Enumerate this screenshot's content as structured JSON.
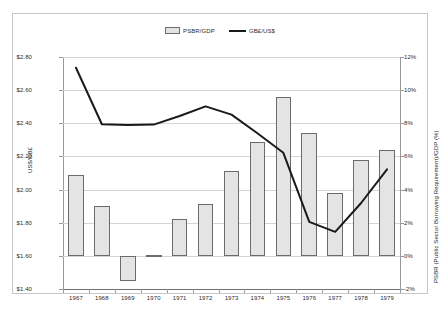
{
  "chart_data": {
    "type": "bar",
    "title": "",
    "subtitle": "",
    "categories": [
      "1967",
      "1968",
      "1969",
      "1970",
      "1971",
      "1972",
      "1973",
      "1974",
      "1975",
      "1976",
      "1977",
      "1978",
      "1979"
    ],
    "xlabel": "",
    "grid": true,
    "legend_position": "top-center",
    "axes": {
      "left": {
        "label": "US$/GB£",
        "ticks": [
          "$2.80",
          "$2.60",
          "$2.40",
          "$2.20",
          "$2.00",
          "$1.80",
          "$1.60",
          "$1.40"
        ],
        "tick_values": [
          2.8,
          2.6,
          2.4,
          2.2,
          2.0,
          1.8,
          1.6,
          1.4
        ],
        "limits": [
          1.4,
          2.8
        ]
      },
      "right": {
        "label": "PSBR (Public Sector Borrowing Requirement)/GDP (%)",
        "ticks": [
          "12%",
          "10%",
          "8%",
          "6%",
          "4%",
          "2%",
          "0%",
          "-2%"
        ],
        "tick_values": [
          12,
          10,
          8,
          6,
          4,
          2,
          0,
          -2
        ],
        "limits": [
          -2,
          12
        ]
      }
    },
    "series": [
      {
        "name": "PSBR/GDP",
        "type": "bar",
        "axis": "right",
        "unit": "%",
        "color": "#e4e4e4",
        "edge_color": "#6b6b6b",
        "pattern": "vertical-hatch",
        "values": [
          4.9,
          3.0,
          -1.5,
          0.05,
          2.2,
          3.1,
          5.1,
          6.9,
          9.6,
          7.4,
          3.8,
          5.8,
          6.4
        ]
      },
      {
        "name": "GB£/US$",
        "type": "line",
        "axis": "left",
        "unit": "US$",
        "color": "#1a1a1a",
        "values": [
          2.735,
          2.394,
          2.39,
          2.392,
          2.444,
          2.502,
          2.452,
          2.34,
          2.222,
          1.805,
          1.745,
          1.919,
          2.122
        ]
      }
    ]
  }
}
